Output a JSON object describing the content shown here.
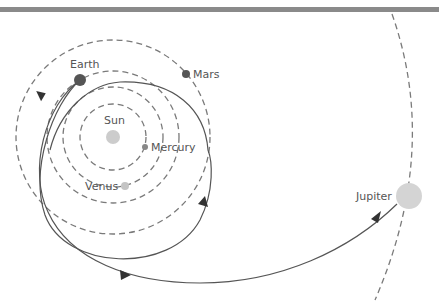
{
  "diagram": {
    "bodies": [
      {
        "name": "Sun",
        "label": "Sun",
        "color": "#cccccc"
      },
      {
        "name": "Mercury",
        "label": "Mercury",
        "color": "#888888"
      },
      {
        "name": "Venus",
        "label": "Venus",
        "color": "#c4c4c4"
      },
      {
        "name": "Earth",
        "label": "Earth",
        "color": "#555555"
      },
      {
        "name": "Mars",
        "label": "Mars",
        "color": "#555555"
      },
      {
        "name": "Jupiter",
        "label": "Jupiter",
        "color": "#d4d4d4"
      }
    ],
    "orbits": [
      "Mercury orbit",
      "Venus orbit",
      "Earth orbit",
      "Mars orbit",
      "Jupiter orbit"
    ],
    "trajectories": [
      "Earth loop trajectory",
      "Earth to Jupiter trajectory"
    ],
    "colors": {
      "orbit": "#7a7a7a",
      "trajectory": "#555555",
      "topbar": "#8a8a8a"
    }
  }
}
